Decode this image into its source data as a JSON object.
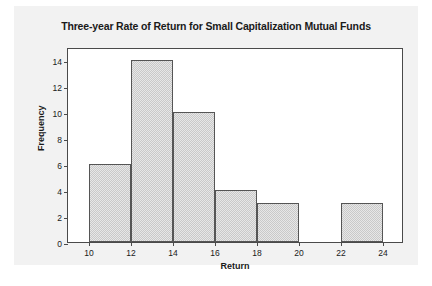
{
  "chart_data": {
    "type": "bar",
    "title": "Three-year Rate of Return for Small Capitalization Mutual Funds",
    "xlabel": "Return",
    "ylabel": "Frequency",
    "xlim": [
      9,
      25
    ],
    "ylim": [
      0,
      15
    ],
    "grid": false,
    "legend": null,
    "bin_width": 2,
    "bin_edges": [
      10,
      12,
      14,
      16,
      18,
      20,
      22,
      24
    ],
    "categories": [
      "10-12",
      "12-14",
      "14-16",
      "16-18",
      "18-20",
      "20-22",
      "22-24"
    ],
    "values": [
      6,
      14,
      10,
      4,
      3,
      0,
      3
    ],
    "bars": [
      {
        "start": 10,
        "end": 12,
        "value": 6
      },
      {
        "start": 12,
        "end": 14,
        "value": 14
      },
      {
        "start": 14,
        "end": 16,
        "value": 10
      },
      {
        "start": 16,
        "end": 18,
        "value": 4
      },
      {
        "start": 18,
        "end": 20,
        "value": 3
      },
      {
        "start": 20,
        "end": 22,
        "value": 0
      },
      {
        "start": 22,
        "end": 24,
        "value": 3
      }
    ],
    "xticks": [
      10,
      12,
      14,
      16,
      18,
      20,
      22,
      24
    ],
    "xtick_labels": [
      "10",
      "12",
      "14",
      "16",
      "18",
      "20",
      "22",
      "24"
    ],
    "yticks": [
      0,
      2,
      4,
      6,
      8,
      10,
      12,
      14
    ],
    "ytick_labels": [
      "0",
      "2",
      "4",
      "6",
      "8",
      "10",
      "12",
      "14"
    ],
    "colors": {
      "bar_fill": "#c9c9c9",
      "bar_border": "#555555",
      "plot_background": "#ffffff",
      "panel_background": "#f2f2f2",
      "axis": "#4a4a4a",
      "text": "#1a1a1a"
    }
  }
}
